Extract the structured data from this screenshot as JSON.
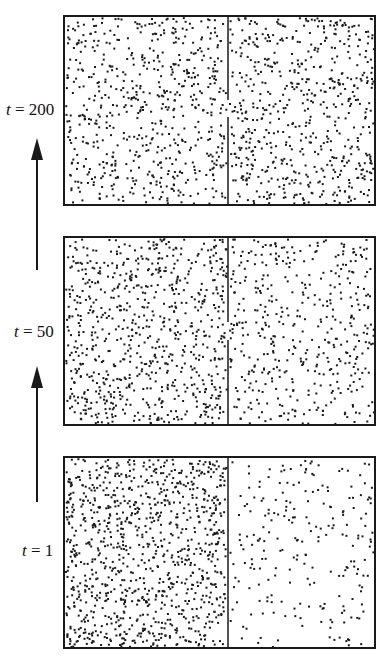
{
  "figure": {
    "ink_color": "#1a1a1a",
    "background": "#ffffff"
  },
  "panels": [
    {
      "id": "t200",
      "time_label_var": "t",
      "time_label_eq": " = ",
      "time_value": "200",
      "partition_has_opening": true,
      "left_particle_count": 620,
      "right_particle_count": 600,
      "left_density": "uniform",
      "right_density": "uniform"
    },
    {
      "id": "t50",
      "time_label_var": "t",
      "time_label_eq": " = ",
      "time_value": "50",
      "partition_has_opening": true,
      "left_particle_count": 760,
      "right_particle_count": 440,
      "left_density": "high",
      "right_density": "medium"
    },
    {
      "id": "t1",
      "time_label_var": "t",
      "time_label_eq": " = ",
      "time_value": "1",
      "partition_has_opening": false,
      "left_particle_count": 1000,
      "right_particle_count": 230,
      "left_density": "very high",
      "right_density": "low"
    }
  ],
  "arrows": [
    {
      "from": "t1",
      "to": "t50",
      "direction": "up"
    },
    {
      "from": "t50",
      "to": "t200",
      "direction": "up"
    }
  ]
}
